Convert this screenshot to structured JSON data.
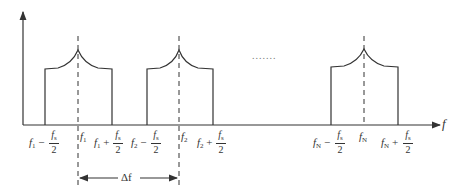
{
  "diagram": {
    "type": "frequency-spectrum",
    "axis_label": "f",
    "ellipsis": ".......",
    "delta_label": "Δf",
    "colors": {
      "stroke": "#333333",
      "background": "#ffffff"
    },
    "bands": [
      {
        "center": "f1",
        "center_label": "f",
        "center_sub": "1",
        "low_label_f": "f",
        "low_label_sub": "1",
        "low_op": "−",
        "high_label_f": "f",
        "high_label_sub": "1",
        "high_op": "+"
      },
      {
        "center": "f2",
        "center_label": "f",
        "center_sub": "2",
        "low_label_f": "f",
        "low_label_sub": "2",
        "low_op": "−",
        "high_label_f": "f",
        "high_label_sub": "2",
        "high_op": "+"
      },
      {
        "center": "fN",
        "center_label": "f",
        "center_sub": "N",
        "low_label_f": "f",
        "low_label_sub": "N",
        "low_op": "−",
        "high_label_f": "f",
        "high_label_sub": "N",
        "high_op": "+"
      }
    ],
    "fraction": {
      "num": "f",
      "num_sub": "s",
      "den": "2"
    }
  }
}
